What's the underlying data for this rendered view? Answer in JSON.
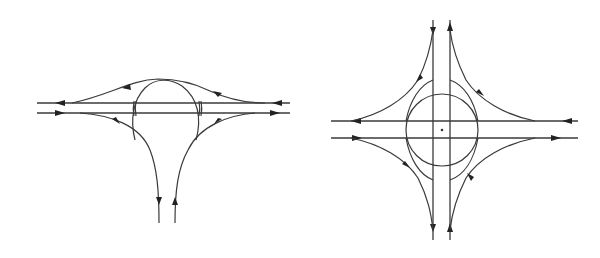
{
  "figure": {
    "type": "interchange-diagrams",
    "colors": {
      "background": "#ffffff",
      "line": "#3a3a3a",
      "arrow": "#222222"
    },
    "left_diagram": {
      "name": "trumpet-style T-interchange with loop",
      "mainline_lanes": 2,
      "branch_lanes": 2
    },
    "right_diagram": {
      "name": "four-way interchange with central ring",
      "mainline_lanes": 2,
      "crossroad_lanes": 2,
      "center_marker": "+"
    }
  }
}
